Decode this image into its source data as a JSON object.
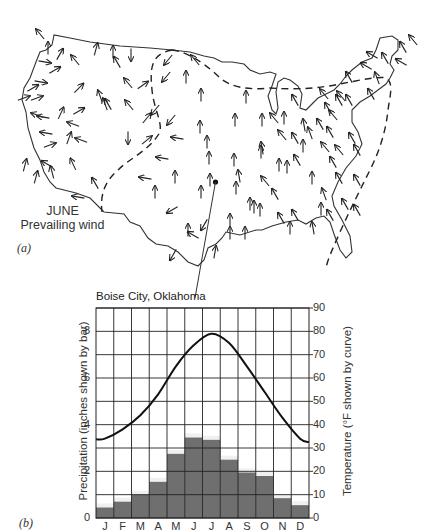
{
  "panel_a": {
    "label": "(a)",
    "caption_line1": "JUNE",
    "caption_line2": "Prevailing wind",
    "marker": {
      "x": 215.5,
      "y": 182
    },
    "pointer_end": {
      "x": 195,
      "y": 298
    },
    "arrows": [
      [
        40,
        34,
        -40
      ],
      [
        48,
        48,
        0
      ],
      [
        60,
        54,
        30
      ],
      [
        75,
        60,
        -40
      ],
      [
        96,
        49,
        15
      ],
      [
        113,
        52,
        0
      ],
      [
        131,
        55,
        180
      ],
      [
        117,
        62,
        -30
      ],
      [
        45,
        62,
        100
      ],
      [
        41,
        82,
        100
      ],
      [
        33,
        88,
        60
      ],
      [
        24,
        98,
        70
      ],
      [
        37,
        98,
        70
      ],
      [
        55,
        70,
        60
      ],
      [
        79,
        88,
        45
      ],
      [
        100,
        96,
        -20
      ],
      [
        108,
        104,
        -30
      ],
      [
        129,
        105,
        -40
      ],
      [
        128,
        83,
        -40
      ],
      [
        143,
        85,
        55
      ],
      [
        61,
        113,
        25
      ],
      [
        79,
        111,
        60
      ],
      [
        37,
        115,
        -70
      ],
      [
        43,
        117,
        -80
      ],
      [
        46,
        133,
        -80
      ],
      [
        73,
        124,
        -70
      ],
      [
        69,
        138,
        20
      ],
      [
        81,
        140,
        -70
      ],
      [
        105,
        104,
        -20
      ],
      [
        128,
        138,
        180
      ],
      [
        147,
        118,
        40
      ],
      [
        147,
        140,
        50
      ],
      [
        25,
        165,
        15
      ],
      [
        36,
        177,
        15
      ],
      [
        47,
        164,
        -60
      ],
      [
        50,
        145,
        70
      ],
      [
        52,
        172,
        -15
      ],
      [
        73,
        164,
        -25
      ],
      [
        95,
        183,
        -30
      ],
      [
        78,
        197,
        -80
      ],
      [
        168,
        60,
        -140
      ],
      [
        195,
        60,
        -40
      ],
      [
        166,
        77,
        -140
      ],
      [
        186,
        77,
        0
      ],
      [
        155,
        110,
        -140
      ],
      [
        171,
        120,
        -140
      ],
      [
        201,
        95,
        0
      ],
      [
        200,
        127,
        0
      ],
      [
        207,
        142,
        0
      ],
      [
        177,
        138,
        -80
      ],
      [
        162,
        158,
        -80
      ],
      [
        209,
        158,
        0
      ],
      [
        175,
        177,
        0
      ],
      [
        145,
        178,
        -80
      ],
      [
        155,
        192,
        0
      ],
      [
        172,
        210,
        -120
      ],
      [
        201,
        192,
        0
      ],
      [
        210,
        180,
        0
      ],
      [
        204,
        225,
        -150
      ],
      [
        230,
        220,
        0
      ],
      [
        188,
        230,
        0
      ],
      [
        236,
        188,
        0
      ],
      [
        235,
        120,
        0
      ],
      [
        246,
        97,
        0
      ],
      [
        234,
        160,
        0
      ],
      [
        239,
        176,
        -10
      ],
      [
        215,
        252,
        10
      ],
      [
        193,
        235,
        -60
      ],
      [
        173,
        255,
        -150
      ],
      [
        230,
        233,
        0
      ],
      [
        245,
        233,
        0
      ],
      [
        265,
        181,
        -40
      ],
      [
        261,
        152,
        0
      ],
      [
        262,
        120,
        0
      ],
      [
        274,
        118,
        -40
      ],
      [
        284,
        118,
        0
      ],
      [
        295,
        100,
        -30
      ],
      [
        282,
        135,
        -40
      ],
      [
        295,
        138,
        -30
      ],
      [
        303,
        146,
        0
      ],
      [
        279,
        165,
        0
      ],
      [
        287,
        167,
        0
      ],
      [
        297,
        160,
        -30
      ],
      [
        304,
        125,
        -10
      ],
      [
        328,
        108,
        -30
      ],
      [
        333,
        115,
        -40
      ],
      [
        320,
        124,
        -30
      ],
      [
        341,
        96,
        -40
      ],
      [
        349,
        77,
        -30
      ],
      [
        324,
        94,
        -40
      ],
      [
        339,
        100,
        -30
      ],
      [
        349,
        100,
        -30
      ],
      [
        371,
        94,
        -30
      ],
      [
        377,
        78,
        -20
      ],
      [
        366,
        66,
        -60
      ],
      [
        372,
        55,
        -60
      ],
      [
        385,
        58,
        -30
      ],
      [
        403,
        47,
        -30
      ],
      [
        413,
        40,
        -40
      ],
      [
        401,
        62,
        -60
      ],
      [
        333,
        162,
        -30
      ],
      [
        339,
        178,
        -30
      ],
      [
        324,
        194,
        -20
      ],
      [
        345,
        204,
        -30
      ],
      [
        357,
        210,
        -30
      ],
      [
        321,
        209,
        0
      ],
      [
        313,
        228,
        -10
      ],
      [
        290,
        228,
        0
      ],
      [
        312,
        178,
        0
      ],
      [
        357,
        180,
        -30
      ],
      [
        330,
        215,
        -30
      ],
      [
        295,
        215,
        -30
      ],
      [
        250,
        204,
        0
      ],
      [
        260,
        210,
        0
      ],
      [
        281,
        218,
        -30
      ],
      [
        275,
        194,
        -30
      ],
      [
        254,
        207,
        0
      ],
      [
        352,
        138,
        -30
      ],
      [
        357,
        150,
        -30
      ],
      [
        339,
        150,
        -40
      ],
      [
        325,
        147,
        -40
      ],
      [
        330,
        132,
        -30
      ],
      [
        310,
        133,
        -20
      ],
      [
        262,
        148,
        -10
      ]
    ]
  },
  "panel_b": {
    "label": "(b)",
    "title": "Boise City, Oklahoma",
    "left_axis_label": "Precipitation (inches shown by bar)",
    "right_axis_label": "Temperature (°F shown by curve)",
    "left_ticks": [
      "0",
      "2",
      "4",
      "6",
      "8"
    ],
    "right_ticks": [
      "0",
      "10",
      "20",
      "30",
      "40",
      "50",
      "60",
      "70",
      "80",
      "90"
    ],
    "months": [
      "J",
      "F",
      "M",
      "A",
      "M",
      "J",
      "J",
      "A",
      "S",
      "O",
      "N",
      "D"
    ],
    "bar_color": "#6f6f6f",
    "bar_highlight": "#f0f0f0"
  },
  "chart_data": {
    "type": "bar+line",
    "title": "Boise City, Oklahoma",
    "categories": [
      "J",
      "F",
      "M",
      "A",
      "M",
      "J",
      "J",
      "A",
      "S",
      "O",
      "N",
      "D"
    ],
    "series": [
      {
        "name": "Precipitation (inches shown by bar)",
        "type": "bar",
        "axis": "left",
        "values": [
          0.45,
          0.7,
          1.0,
          1.55,
          2.75,
          3.45,
          3.35,
          2.5,
          1.95,
          1.8,
          0.85,
          0.55
        ]
      },
      {
        "name": "Temperature (°F shown by curve)",
        "type": "line",
        "axis": "right",
        "values": [
          34,
          38,
          44,
          53,
          65,
          74,
          79,
          75,
          65,
          54,
          43,
          34
        ]
      }
    ],
    "xlabel": "",
    "ylabel_left": "Precipitation (inches shown by bar)",
    "ylabel_right": "Temperature (°F shown by curve)",
    "ylim_left": [
      0,
      9
    ],
    "ylim_right": [
      0,
      90
    ],
    "left_ticks": [
      0,
      2,
      4,
      6,
      8
    ],
    "right_ticks": [
      0,
      10,
      20,
      30,
      40,
      50,
      60,
      70,
      80,
      90
    ],
    "grid": true,
    "legend": "none"
  }
}
